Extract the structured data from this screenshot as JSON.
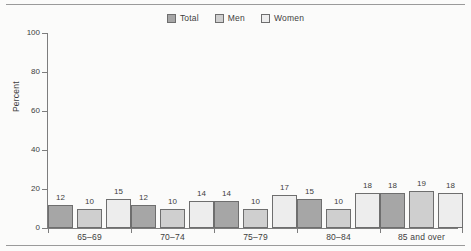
{
  "figure": {
    "background": "#fbfbfa",
    "has_top_rule": true,
    "has_bottom_rule": true
  },
  "legend": {
    "position": "top-center",
    "items": [
      {
        "label": "Total",
        "color": "#a6a6a6"
      },
      {
        "label": "Men",
        "color": "#cfcfcf"
      },
      {
        "label": "Women",
        "color": "#ededed"
      }
    ]
  },
  "axes": {
    "ylabel": "Percent",
    "yticks": [
      0,
      20,
      40,
      60,
      80,
      100
    ],
    "ytick_labels": [
      "0",
      "20",
      "40",
      "60",
      "80",
      "100"
    ],
    "ylim": [
      0,
      100
    ],
    "xlabel": ""
  },
  "chart_data": {
    "type": "bar",
    "title": "",
    "subtitle": "",
    "xlabel": "",
    "ylabel": "Percent",
    "ylim": [
      0,
      100
    ],
    "yticks": [
      0,
      20,
      40,
      60,
      80,
      100
    ],
    "grid": false,
    "legend_position": "top-center",
    "categories": [
      "65–69",
      "70–74",
      "75–79",
      "80–84",
      "85 and over"
    ],
    "series": [
      {
        "name": "Total",
        "color": "#a6a6a6",
        "values": [
          12,
          12,
          14,
          15,
          18
        ]
      },
      {
        "name": "Men",
        "color": "#cfcfcf",
        "values": [
          10,
          10,
          10,
          10,
          19
        ]
      },
      {
        "name": "Women",
        "color": "#ededed",
        "values": [
          15,
          14,
          17,
          18,
          18
        ]
      }
    ],
    "data_labels": true
  }
}
